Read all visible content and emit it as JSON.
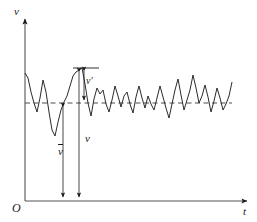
{
  "figure": {
    "background_color": "#ffffff",
    "line_color": "#1a1a1a"
  },
  "labels": {
    "v_axis": "v",
    "t_axis": "t",
    "origin": "O",
    "v_mean": "v",
    "v_instant": "v",
    "v_fluct": "v′"
  },
  "chart_data": {
    "type": "line",
    "xlabel": "t",
    "ylabel": "v",
    "grid": false,
    "legend": null,
    "axes": {
      "origin_label": "O",
      "x_axis": {
        "start_px": 25,
        "end_px": 248,
        "y_px": 201,
        "arrow": true
      },
      "y_axis": {
        "start_px": 201,
        "end_px": 18,
        "x_px": 25,
        "arrow": true
      }
    },
    "mean_line": {
      "label": "v̄",
      "style": "dashed",
      "y_px": 103,
      "x_start_px": 25,
      "x_end_px": 232
    },
    "annotations": [
      {
        "name": "v-mean-arrow",
        "label": "v̄",
        "type": "double-arrow-vertical",
        "x_px": 63,
        "y_top_px": 103,
        "y_bottom_px": 201
      },
      {
        "name": "v-instant-arrow",
        "label": "v",
        "type": "double-arrow-vertical",
        "x_px": 79,
        "y_top_px": 68,
        "y_bottom_px": 201
      },
      {
        "name": "v-fluct-arrow",
        "label": "v′",
        "type": "double-arrow-vertical",
        "x_px": 79,
        "y_top_px": 68,
        "y_bottom_px": 103
      },
      {
        "name": "v-fluct-tick",
        "label": "",
        "type": "horizontal-tick",
        "x_start_px": 73,
        "x_end_px": 99,
        "y_px": 68
      }
    ],
    "series": [
      {
        "name": "instantaneous velocity",
        "x": [
          25,
          28,
          31,
          34,
          37,
          40,
          43,
          46,
          49,
          52,
          55,
          58,
          61,
          64,
          67,
          70,
          73,
          76,
          79,
          82,
          85,
          88,
          91,
          94,
          97,
          100,
          103,
          106,
          109,
          112,
          115,
          118,
          121,
          124,
          127,
          130,
          133,
          136,
          139,
          142,
          145,
          148,
          151,
          154,
          157,
          160,
          163,
          166,
          169,
          172,
          175,
          178,
          181,
          184,
          187,
          190,
          193,
          196,
          199,
          202,
          205,
          208,
          211,
          214,
          217,
          220,
          223,
          226,
          229,
          232
        ],
        "y": [
          73,
          78,
          92,
          103,
          112,
          98,
          80,
          92,
          112,
          130,
          136,
          122,
          110,
          102,
          96,
          86,
          76,
          72,
          70,
          68,
          84,
          103,
          116,
          99,
          88,
          94,
          90,
          104,
          112,
          100,
          86,
          96,
          107,
          96,
          92,
          104,
          113,
          97,
          86,
          98,
          108,
          96,
          104,
          110,
          98,
          86,
          97,
          108,
          118,
          104,
          90,
          79,
          95,
          110,
          100,
          90,
          75,
          88,
          103,
          96,
          85,
          97,
          112,
          101,
          88,
          98,
          110,
          104,
          96,
          82
        ]
      }
    ]
  }
}
